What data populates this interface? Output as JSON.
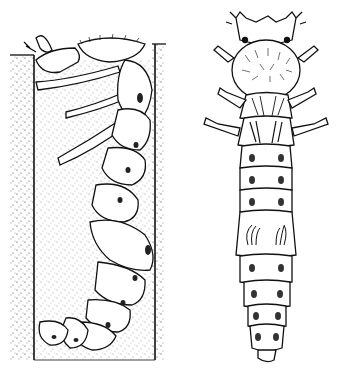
{
  "figure": {
    "colors": {
      "background": "#ffffff",
      "ink": "#111111",
      "stipple": "#333333"
    },
    "panels": [
      {
        "id": "burrow-view",
        "label": ""
      },
      {
        "id": "dorsal-view",
        "label": ""
      }
    ]
  }
}
